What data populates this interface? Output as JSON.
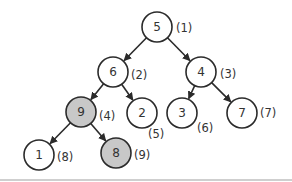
{
  "diagram": {
    "type": "binary-tree",
    "colors": {
      "node_fill": "#ffffff",
      "highlight_fill": "#c8c8c8",
      "stroke": "#2b2b2b"
    },
    "nodes": [
      {
        "id": "n1",
        "value": "5",
        "index_label": "(1)",
        "x": 157,
        "y": 27,
        "highlight": false,
        "lx": 176,
        "ly": 28
      },
      {
        "id": "n2",
        "value": "6",
        "index_label": "(2)",
        "x": 113,
        "y": 72,
        "highlight": false,
        "lx": 131,
        "ly": 75
      },
      {
        "id": "n3",
        "value": "4",
        "index_label": "(3)",
        "x": 201,
        "y": 72,
        "highlight": false,
        "lx": 220,
        "ly": 74
      },
      {
        "id": "n4",
        "value": "9",
        "index_label": "(4)",
        "x": 81,
        "y": 112,
        "highlight": true,
        "lx": 99,
        "ly": 116
      },
      {
        "id": "n5",
        "value": "2",
        "index_label": "(5)",
        "x": 142,
        "y": 113,
        "highlight": false,
        "lx": 148,
        "ly": 134
      },
      {
        "id": "n6",
        "value": "3",
        "index_label": "(6)",
        "x": 182,
        "y": 113,
        "highlight": false,
        "lx": 197,
        "ly": 128
      },
      {
        "id": "n7",
        "value": "7",
        "index_label": "(7)",
        "x": 242,
        "y": 113,
        "highlight": false,
        "lx": 260,
        "ly": 113
      },
      {
        "id": "n8",
        "value": "1",
        "index_label": "(8)",
        "x": 39,
        "y": 155,
        "highlight": false,
        "lx": 57,
        "ly": 157
      },
      {
        "id": "n9",
        "value": "8",
        "index_label": "(9)",
        "x": 116,
        "y": 153,
        "highlight": true,
        "lx": 134,
        "ly": 155
      }
    ],
    "edges": [
      {
        "from": "n1",
        "to": "n2"
      },
      {
        "from": "n1",
        "to": "n3"
      },
      {
        "from": "n2",
        "to": "n4"
      },
      {
        "from": "n2",
        "to": "n5"
      },
      {
        "from": "n3",
        "to": "n6"
      },
      {
        "from": "n3",
        "to": "n7"
      },
      {
        "from": "n4",
        "to": "n8"
      },
      {
        "from": "n4",
        "to": "n9"
      }
    ]
  }
}
